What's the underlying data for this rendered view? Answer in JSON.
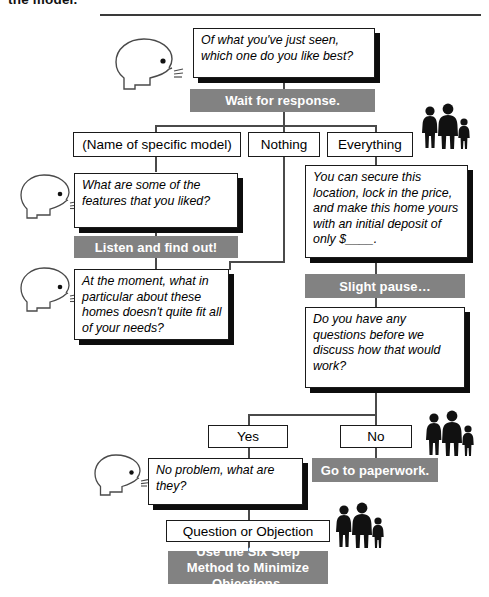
{
  "document": {
    "top_heading": "the model.",
    "title": "Sales Dialogue Flowchart"
  },
  "nodes": {
    "q_opening": "Of what you've just seen, which one do you like best?",
    "action_wait": "Wait for response.",
    "opt_model": "(Name of specific model)",
    "opt_nothing": "Nothing",
    "opt_everything": "Everything",
    "q_features": "What are some of the features that you liked?",
    "action_listen": "Listen and find out!",
    "q_moment": "At the moment, what in particular about these homes doesn't quite fit all of your needs?",
    "stmt_secure": "You can secure this location, lock in the price, and make this home yours with an initial deposit of only $____.",
    "action_pause": "Slight pause…",
    "q_questions": "Do you have any questions before we discuss how that would work?",
    "opt_yes": "Yes",
    "opt_no": "No",
    "q_noproblem": "No problem, what are they?",
    "action_paperwork": "Go to paperwork.",
    "node_objection": "Question or Objection",
    "action_sixstep": "Use the Six Step Method to Minimize Objections."
  },
  "icons": {
    "speaker_head": "speaking-head-icon",
    "family": "family-silhouette-icon"
  },
  "colors": {
    "gray_bar": "#828282",
    "box_border": "#1a1a1a",
    "shadow": "#0d0d0d",
    "line": "#4a4a4a",
    "background": "#ffffff"
  }
}
